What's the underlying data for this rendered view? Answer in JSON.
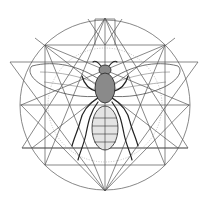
{
  "illustration": {
    "subject": "bee",
    "style": "sacred-geometry line engraving",
    "colors": {
      "background": "#ffffff",
      "lines": "#555555",
      "body_dark": "#8a8a8a",
      "body_light": "#e4e4e4",
      "ink": "#222222"
    },
    "geometry": {
      "circle": {
        "cx": 105,
        "cy": 105,
        "r": 85
      },
      "square": {
        "x": 45,
        "y": 45,
        "size": 120
      },
      "inverted_triangle": {
        "points": [
          [
            10,
            62
          ],
          [
            198,
            62
          ],
          [
            105,
            191
          ]
        ]
      },
      "upright_triangle": {
        "points": [
          [
            105,
            18
          ],
          [
            22,
            148
          ],
          [
            188,
            148
          ]
        ]
      }
    }
  }
}
